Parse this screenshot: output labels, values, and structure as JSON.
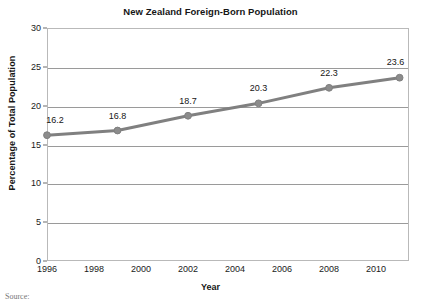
{
  "chart_data": {
    "type": "line",
    "title": "New Zealand Foreign-Born Population",
    "xlabel": "Year",
    "ylabel": "Percentage of Total Population",
    "x": [
      1996,
      1999,
      2002,
      2005,
      2008,
      2011
    ],
    "values": [
      16.2,
      16.8,
      18.7,
      20.3,
      22.3,
      23.6
    ],
    "point_labels": [
      "16.2",
      "16.8",
      "18.7",
      "20.3",
      "22.3",
      "23.6"
    ],
    "xlim": [
      1996,
      2011.4
    ],
    "ylim": [
      0,
      30
    ],
    "x_tick_labels": [
      "1996",
      "1998",
      "2000",
      "2002",
      "2004",
      "2006",
      "2008",
      "2010"
    ],
    "x_ticks": [
      1996,
      1998,
      2000,
      2002,
      2004,
      2006,
      2008,
      2010
    ],
    "y_tick_labels": [
      "0",
      "5",
      "10",
      "15",
      "20",
      "25",
      "30"
    ],
    "y_ticks": [
      0,
      5,
      10,
      15,
      20,
      25,
      30
    ],
    "grid": "horizontal",
    "legend": "none",
    "series_color": "#808080",
    "marker_color": "#8c8c8c",
    "gridline_color": "#9a9a9a",
    "frame_color": "#b9b9b9"
  },
  "footer": {
    "source_note": "Source:"
  }
}
